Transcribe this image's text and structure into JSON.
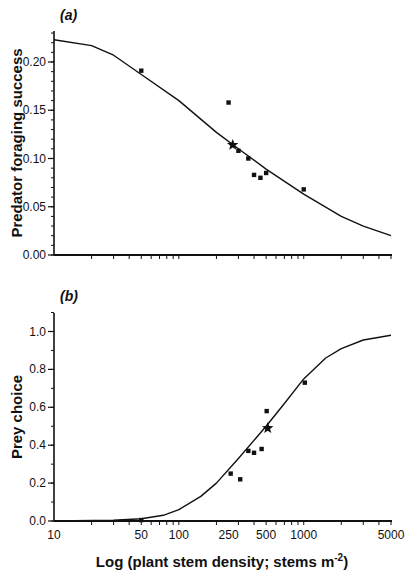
{
  "chart_data": [
    {
      "type": "scatter",
      "panel_label": "(a)",
      "title": "",
      "xlabel": "Log (plant stem density; stems m-2)",
      "ylabel": "Predator foraging success",
      "x_scale": "log",
      "xlim": [
        10,
        5000
      ],
      "ylim": [
        0,
        0.23
      ],
      "y_ticks": [
        0.0,
        0.05,
        0.1,
        0.15,
        0.2
      ],
      "y_tick_labels": [
        "0.00",
        "0.05",
        "0.10",
        "0.15",
        "0.20"
      ],
      "y_minor_step": 0.01,
      "grid": false,
      "series": [
        {
          "name": "observed",
          "marker": "square",
          "points": [
            {
              "x": 50,
              "y": 0.191
            },
            {
              "x": 250,
              "y": 0.158
            },
            {
              "x": 300,
              "y": 0.108
            },
            {
              "x": 360,
              "y": 0.1
            },
            {
              "x": 400,
              "y": 0.083
            },
            {
              "x": 450,
              "y": 0.08
            },
            {
              "x": 500,
              "y": 0.085
            },
            {
              "x": 1000,
              "y": 0.068
            }
          ]
        },
        {
          "name": "reference",
          "marker": "star",
          "points": [
            {
              "x": 270,
              "y": 0.114
            }
          ]
        },
        {
          "name": "fitted curve",
          "marker": "line",
          "points": [
            {
              "x": 10,
              "y": 0.223
            },
            {
              "x": 20,
              "y": 0.217
            },
            {
              "x": 30,
              "y": 0.207
            },
            {
              "x": 50,
              "y": 0.187
            },
            {
              "x": 100,
              "y": 0.16
            },
            {
              "x": 200,
              "y": 0.127
            },
            {
              "x": 300,
              "y": 0.11
            },
            {
              "x": 500,
              "y": 0.089
            },
            {
              "x": 1000,
              "y": 0.063
            },
            {
              "x": 2000,
              "y": 0.04
            },
            {
              "x": 3000,
              "y": 0.03
            },
            {
              "x": 5000,
              "y": 0.02
            }
          ]
        }
      ]
    },
    {
      "type": "scatter",
      "panel_label": "(b)",
      "title": "",
      "xlabel": "Log (plant stem density; stems m-2)",
      "ylabel": "Prey choice",
      "x_scale": "log",
      "xlim": [
        10,
        5000
      ],
      "ylim": [
        0,
        1.1
      ],
      "y_ticks": [
        0.0,
        0.2,
        0.4,
        0.6,
        0.8,
        1.0
      ],
      "y_tick_labels": [
        "0.0",
        "0.2",
        "0.4",
        "0.6",
        "0.8",
        "1.0"
      ],
      "y_minor_step": 0.1,
      "x_ticks": [
        10,
        50,
        100,
        250,
        500,
        1000,
        5000
      ],
      "x_tick_labels": [
        "10",
        "50",
        "100",
        "250",
        "500",
        "1000",
        "5000"
      ],
      "grid": false,
      "series": [
        {
          "name": "observed",
          "marker": "square",
          "points": [
            {
              "x": 50,
              "y": 0.005
            },
            {
              "x": 260,
              "y": 0.25
            },
            {
              "x": 310,
              "y": 0.22
            },
            {
              "x": 360,
              "y": 0.37
            },
            {
              "x": 400,
              "y": 0.36
            },
            {
              "x": 460,
              "y": 0.38
            },
            {
              "x": 505,
              "y": 0.58
            },
            {
              "x": 1020,
              "y": 0.73
            }
          ]
        },
        {
          "name": "reference",
          "marker": "star",
          "points": [
            {
              "x": 515,
              "y": 0.49
            }
          ]
        },
        {
          "name": "fitted curve",
          "marker": "line",
          "points": [
            {
              "x": 10,
              "y": 0.0
            },
            {
              "x": 30,
              "y": 0.004
            },
            {
              "x": 50,
              "y": 0.012
            },
            {
              "x": 75,
              "y": 0.03
            },
            {
              "x": 100,
              "y": 0.06
            },
            {
              "x": 150,
              "y": 0.13
            },
            {
              "x": 200,
              "y": 0.2
            },
            {
              "x": 300,
              "y": 0.33
            },
            {
              "x": 500,
              "y": 0.5
            },
            {
              "x": 700,
              "y": 0.62
            },
            {
              "x": 1000,
              "y": 0.75
            },
            {
              "x": 1500,
              "y": 0.86
            },
            {
              "x": 2000,
              "y": 0.91
            },
            {
              "x": 3000,
              "y": 0.955
            },
            {
              "x": 5000,
              "y": 0.98
            }
          ]
        }
      ]
    }
  ],
  "panels": {
    "a": {
      "label": "(a)",
      "ylabel": "Predator foraging success"
    },
    "b": {
      "label": "(b)",
      "ylabel": "Prey choice"
    }
  },
  "x_axis": {
    "title_prefix": "Log (plant stem density; stems m",
    "title_sup": "-2",
    "title_suffix": ")",
    "tick_labels": [
      "10",
      "50",
      "100",
      "250",
      "500",
      "1000",
      "5000"
    ]
  }
}
